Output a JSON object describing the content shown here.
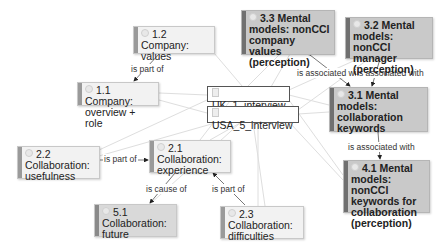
{
  "diagram": {
    "nodes": [
      {
        "id": "n12",
        "code": "1.2",
        "label": "Company: values",
        "line1": "1.2 Company:",
        "line2": "values",
        "style": "light"
      },
      {
        "id": "n11",
        "code": "1.1",
        "label": "Company: overview + role",
        "line1": "1.1 Company:",
        "line2": "overview + role",
        "style": "light"
      },
      {
        "id": "uk1",
        "label": "UK_1_interview",
        "style": "document"
      },
      {
        "id": "usa5",
        "label": "USA_5_interview",
        "style": "document"
      },
      {
        "id": "n33",
        "code": "3.3",
        "line1": "3.3 Mental",
        "line2": "models: nonCCI",
        "line3": "company values",
        "line4": "(perception)",
        "style": "dark"
      },
      {
        "id": "n32",
        "code": "3.2",
        "line1": "3.2 Mental",
        "line2": "models: nonCCI",
        "line3": "manager",
        "line4": "(perception)",
        "style": "dark"
      },
      {
        "id": "n31",
        "code": "3.1",
        "line1": "3.1 Mental",
        "line2": "models:",
        "line3": "collaboration",
        "line4": "keywords",
        "style": "dark"
      },
      {
        "id": "n41",
        "code": "4.1",
        "line1": "4.1 Mental",
        "line2": "models: nonCCI",
        "line3": "keywords for",
        "line4": "collaboration",
        "line5": "(perception)",
        "style": "dark"
      },
      {
        "id": "n22",
        "code": "2.2",
        "line1": "2.2",
        "line2": "Collaboration:",
        "line3": "usefulness",
        "style": "light"
      },
      {
        "id": "n21",
        "code": "2.1",
        "line1": "2.1",
        "line2": "Collaboration:",
        "line3": "experience",
        "style": "light"
      },
      {
        "id": "n51",
        "code": "5.1",
        "line1": "5.1",
        "line2": "Collaboration:",
        "line3": "future",
        "style": "medium"
      },
      {
        "id": "n23",
        "code": "2.3",
        "line1": "2.3",
        "line2": "Collaboration:",
        "line3": "difficulties",
        "style": "light"
      }
    ],
    "edges": [
      {
        "from": "n12",
        "to": "n11",
        "label": "is part of"
      },
      {
        "from": "n31",
        "to": "n33",
        "label": "is associated with"
      },
      {
        "from": "n31",
        "to": "n32",
        "label": "is associated with"
      },
      {
        "from": "n31",
        "to": "n41",
        "label": "is associated with"
      },
      {
        "from": "n22",
        "to": "n21",
        "label": "is part of"
      },
      {
        "from": "n21",
        "to": "n51",
        "label": "is cause of"
      },
      {
        "from": "n23",
        "to": "n21",
        "label": "is part of"
      }
    ],
    "edge_labels": {
      "e1": "is part of",
      "e2": "is associated with",
      "e3": "is associated with",
      "e4": "is associated with",
      "e5": "is part of",
      "e6": "is cause of",
      "e7": "is part of"
    },
    "colors": {
      "light_node_bg": "#f2f2f2",
      "medium_node_bg": "#d9d9d9",
      "dark_node_bg": "#c9c9c9",
      "document_node_bg": "#ffffff",
      "link_line": "#dddddd",
      "relation_line": "#444444"
    }
  }
}
